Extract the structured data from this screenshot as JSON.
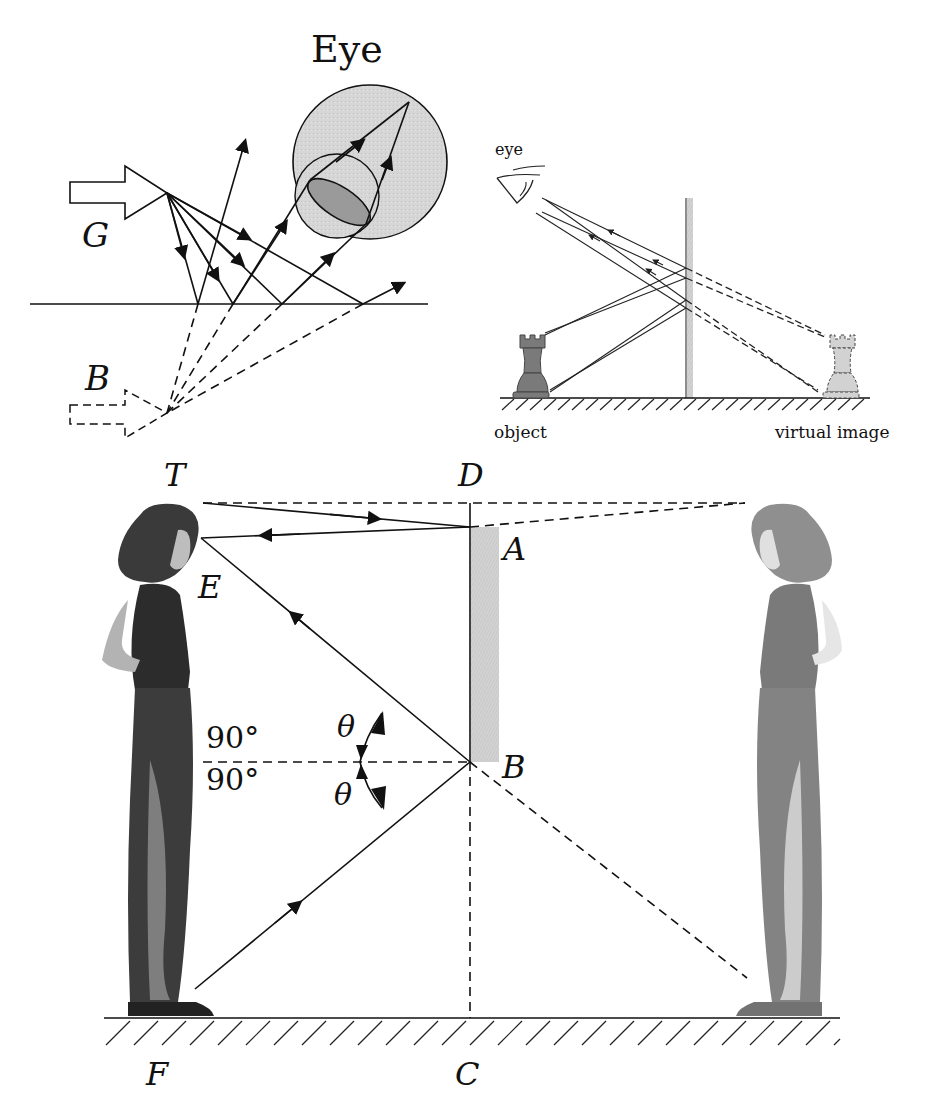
{
  "panel_reflection_eye": {
    "title": "Eye",
    "source_label": "G",
    "image_label": "B"
  },
  "panel_mirror_rook": {
    "eye_label": "eye",
    "object_label": "object",
    "image_label": "virtual image"
  },
  "panel_full_length_mirror": {
    "points": {
      "top": "T",
      "mirror_top_line": "D",
      "mirror_top": "A",
      "eye": "E",
      "middle": "M",
      "mirror_bottom": "B",
      "feet": "F",
      "floor_below_mirror": "C"
    },
    "angles": {
      "upper_right_angle": "90°",
      "lower_right_angle": "90°",
      "incidence": "θ",
      "reflection": "θ"
    }
  },
  "colors": {
    "ink": "#111111",
    "eye_fill": "#d4d4d4",
    "lens_fill": "#9a9a9a",
    "mirror_fill": "#cfcfcf",
    "rook_object": "#7a7a7a",
    "rook_image": "#d2d2d2"
  }
}
